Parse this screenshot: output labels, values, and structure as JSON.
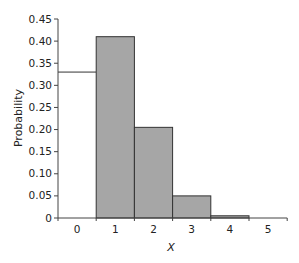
{
  "chart_data": {
    "type": "bar",
    "title": "",
    "xlabel": "X",
    "ylabel": "Probability",
    "categories": [
      "0",
      "1",
      "2",
      "3",
      "4",
      "5"
    ],
    "values": [
      0.33,
      0.41,
      0.205,
      0.05,
      0.005,
      0.0
    ],
    "bar_styles": [
      "unfilled",
      "filled",
      "filled",
      "filled",
      "filled",
      "unfilled"
    ],
    "yticks": [
      "0",
      "0.05",
      "0.10",
      "0.15",
      "0.20",
      "0.25",
      "0.30",
      "0.35",
      "0.40",
      "0.45"
    ],
    "ylim": [
      0,
      0.45
    ],
    "grid": false,
    "legend": null,
    "colors": {
      "bar_fill": "#a6a6a6",
      "bar_edge": "#333333",
      "axis": "#444444"
    }
  }
}
